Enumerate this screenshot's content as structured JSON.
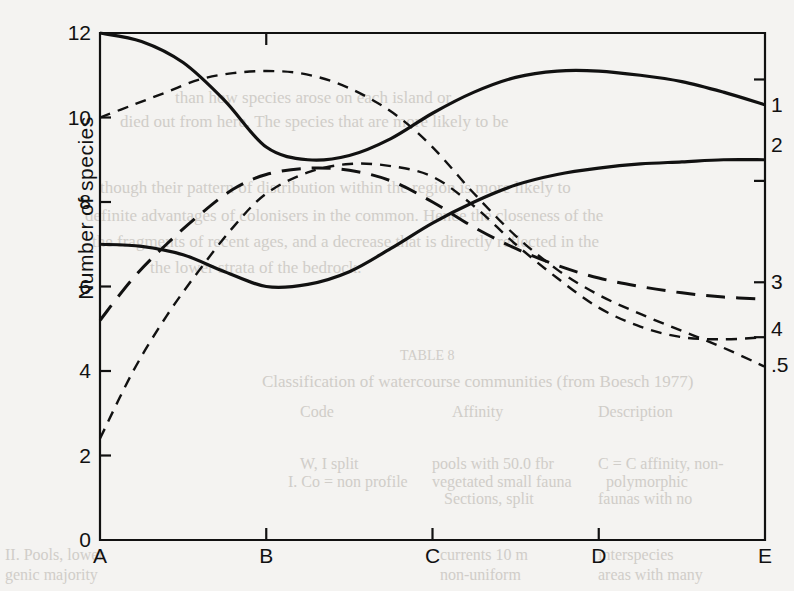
{
  "figure": {
    "background_color": "#f4f3f1",
    "ink_color": "#111111",
    "ylabel": "Number of species"
  },
  "bleed_text": [
    {
      "text": "than how species arose on each island or",
      "x": 175,
      "y": 88,
      "size": 17
    },
    {
      "text": "died out from here. The species that are more likely to be",
      "x": 120,
      "y": 112,
      "size": 17
    },
    {
      "text": "though their pattern of distribution within the region is more likely to",
      "x": 100,
      "y": 178,
      "size": 17
    },
    {
      "text": "definite advantages of colonisers in the common. Hence the closeness of the",
      "x": 85,
      "y": 206,
      "size": 17
    },
    {
      "text": "the fragments of recent ages, and a decrease that is directly reflected in the",
      "x": 92,
      "y": 232,
      "size": 17
    },
    {
      "text": "the lower strata of the bedrock.",
      "x": 150,
      "y": 258,
      "size": 17
    },
    {
      "text": "TABLE 8",
      "x": 400,
      "y": 348,
      "size": 14
    },
    {
      "text": "Classification of watercourse communities (from Boesch 1977)",
      "x": 262,
      "y": 372,
      "size": 17
    },
    {
      "text": "Code",
      "x": 300,
      "y": 403,
      "size": 16
    },
    {
      "text": "Affinity",
      "x": 452,
      "y": 403,
      "size": 16
    },
    {
      "text": "Description",
      "x": 598,
      "y": 403,
      "size": 16
    },
    {
      "text": "W, I  split",
      "x": 300,
      "y": 455,
      "size": 16
    },
    {
      "text": "pools with 50.0 fbr",
      "x": 432,
      "y": 455,
      "size": 16
    },
    {
      "text": "C = C affinity, non-",
      "x": 598,
      "y": 455,
      "size": 16
    },
    {
      "text": "I. Co  = non profile",
      "x": 288,
      "y": 473,
      "size": 16
    },
    {
      "text": "vegetated small fauna",
      "x": 432,
      "y": 473,
      "size": 16
    },
    {
      "text": "polymorphic",
      "x": 606,
      "y": 473,
      "size": 16
    },
    {
      "text": "Sections, split",
      "x": 444,
      "y": 490,
      "size": 16
    },
    {
      "text": "faunas with no",
      "x": 598,
      "y": 490,
      "size": 16
    },
    {
      "text": "II. Pools, lower",
      "x": 5,
      "y": 546,
      "size": 16
    },
    {
      "text": "currents 10 m",
      "x": 440,
      "y": 546,
      "size": 16
    },
    {
      "text": "interspecies",
      "x": 598,
      "y": 546,
      "size": 16
    },
    {
      "text": "genic majority",
      "x": 5,
      "y": 566,
      "size": 16
    },
    {
      "text": "non-uniform",
      "x": 440,
      "y": 566,
      "size": 16
    },
    {
      "text": "areas with many",
      "x": 598,
      "y": 566,
      "size": 16
    }
  ],
  "chart_data": {
    "type": "line",
    "title": "",
    "xlabel": "",
    "ylabel": "Number of species",
    "xlim": [
      0,
      4
    ],
    "ylim": [
      0,
      12
    ],
    "x_tick_labels": [
      "A",
      "B",
      "C",
      "D",
      "E"
    ],
    "x_tick_values": [
      0,
      1,
      2,
      3,
      4
    ],
    "y_tick_labels": [
      "0",
      "2",
      "4",
      "6",
      "8",
      "10",
      "12"
    ],
    "y_tick_values": [
      0,
      2,
      4,
      6,
      8,
      10,
      12
    ],
    "grid": false,
    "legend": "curve numbers at right edge",
    "series": [
      {
        "name": "1",
        "label": "1",
        "style": "solid",
        "line_width": 3.2,
        "label_y": 10.3,
        "x": [
          0,
          0.25,
          0.5,
          0.75,
          1.0,
          1.25,
          1.5,
          1.75,
          2.0,
          2.25,
          2.5,
          2.75,
          3.0,
          3.25,
          3.5,
          3.75,
          4.0
        ],
        "y": [
          12.0,
          11.8,
          11.3,
          10.4,
          9.3,
          9.0,
          9.1,
          9.5,
          10.1,
          10.6,
          10.95,
          11.1,
          11.1,
          11.0,
          10.85,
          10.6,
          10.3
        ]
      },
      {
        "name": "2",
        "label": "2",
        "style": "solid",
        "line_width": 3.2,
        "label_y": 9.35,
        "x": [
          0,
          0.25,
          0.5,
          0.75,
          1.0,
          1.25,
          1.5,
          1.75,
          2.0,
          2.25,
          2.5,
          2.75,
          3.0,
          3.25,
          3.5,
          3.75,
          4.0
        ],
        "y": [
          7.0,
          6.95,
          6.75,
          6.35,
          6.0,
          6.05,
          6.35,
          6.9,
          7.5,
          8.0,
          8.4,
          8.65,
          8.8,
          8.9,
          8.95,
          9.0,
          9.0
        ]
      },
      {
        "name": "3",
        "label": "3",
        "style": "long-dash",
        "line_width": 3.0,
        "label_y": 6.1,
        "x": [
          0,
          0.2,
          0.4,
          0.6,
          0.8,
          1.0,
          1.25,
          1.5,
          1.75,
          2.0,
          2.25,
          2.5,
          2.75,
          3.0,
          3.25,
          3.5,
          3.75,
          4.0
        ],
        "y": [
          5.2,
          6.2,
          7.0,
          7.7,
          8.3,
          8.65,
          8.8,
          8.75,
          8.5,
          8.0,
          7.4,
          6.9,
          6.5,
          6.2,
          6.0,
          5.85,
          5.75,
          5.7
        ]
      },
      {
        "name": "4",
        "label": "4",
        "style": "dash",
        "line_width": 2.4,
        "label_y": 5.0,
        "x": [
          0,
          0.2,
          0.4,
          0.6,
          0.8,
          1.0,
          1.25,
          1.5,
          1.75,
          2.0,
          2.25,
          2.5,
          2.75,
          3.0,
          3.25,
          3.5,
          3.75,
          4.0
        ],
        "y": [
          2.4,
          4.0,
          5.3,
          6.4,
          7.4,
          8.2,
          8.7,
          8.9,
          8.85,
          8.6,
          7.9,
          7.0,
          6.2,
          5.5,
          5.05,
          4.8,
          4.75,
          4.8
        ]
      },
      {
        "name": "5",
        "label": ".5",
        "style": "dash",
        "line_width": 2.4,
        "label_y": 4.15,
        "x": [
          0,
          0.2,
          0.4,
          0.6,
          0.8,
          1.0,
          1.2,
          1.4,
          1.6,
          1.8,
          2.0,
          2.25,
          2.5,
          2.75,
          3.0,
          3.25,
          3.5,
          3.75,
          4.0
        ],
        "y": [
          10.0,
          10.3,
          10.6,
          10.9,
          11.05,
          11.1,
          11.05,
          10.85,
          10.5,
          10.0,
          9.3,
          8.2,
          7.2,
          6.4,
          5.8,
          5.35,
          4.95,
          4.55,
          4.1
        ]
      }
    ]
  }
}
